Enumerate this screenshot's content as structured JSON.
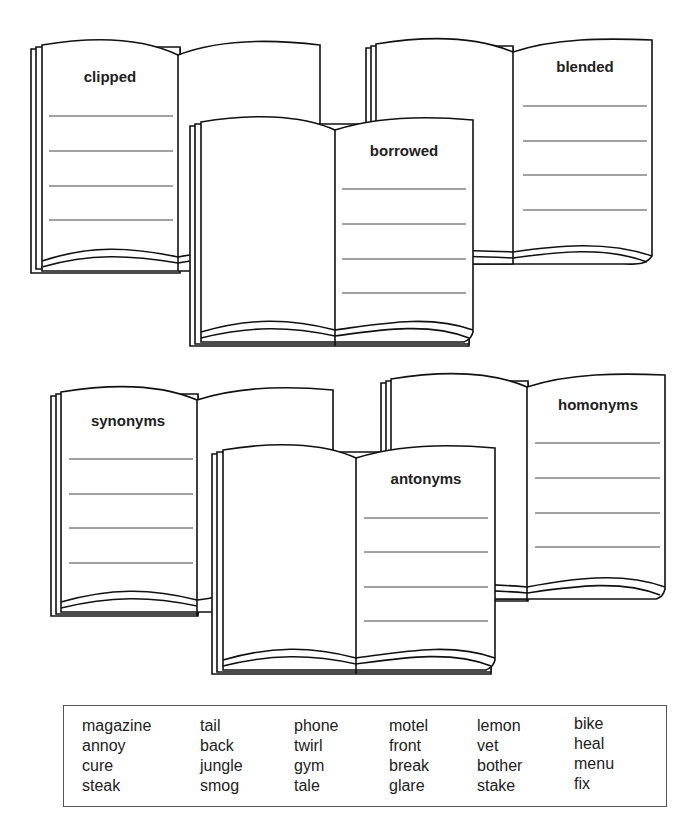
{
  "books": [
    {
      "id": "clipped",
      "title": "clipped",
      "lines": 4
    },
    {
      "id": "blended",
      "title": "blended",
      "lines": 4
    },
    {
      "id": "borrowed",
      "title": "borrowed",
      "lines": 4
    },
    {
      "id": "synonyms",
      "title": "synonyms",
      "lines": 4
    },
    {
      "id": "homonyms",
      "title": "homonyms",
      "lines": 4
    },
    {
      "id": "antonyms",
      "title": "antonyms",
      "lines": 4
    }
  ],
  "word_bank": {
    "columns": [
      [
        "magazine",
        "annoy",
        "cure",
        "steak"
      ],
      [
        "tail",
        "back",
        "jungle",
        "smog"
      ],
      [
        "phone",
        "twirl",
        "gym",
        "tale"
      ],
      [
        "motel",
        "front",
        "break",
        "glare"
      ],
      [
        "lemon",
        "vet",
        "bother",
        "stake"
      ],
      [
        "bike",
        "heal",
        "menu",
        "fix"
      ]
    ]
  }
}
